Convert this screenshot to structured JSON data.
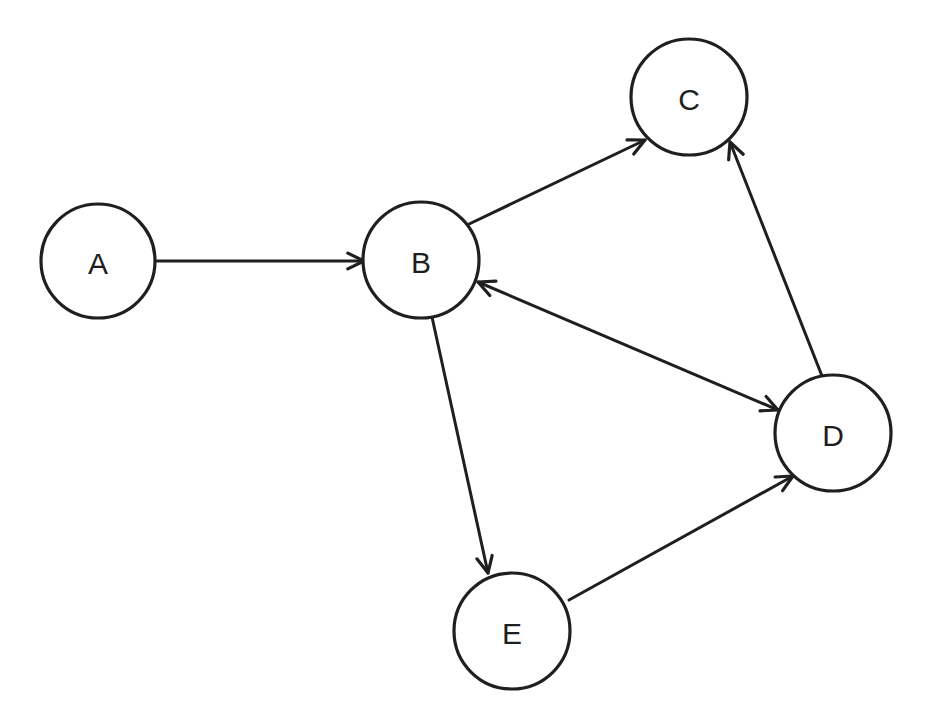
{
  "diagram": {
    "type": "directed-graph",
    "colors": {
      "stroke": "#1f1f1f",
      "background": "#ffffff",
      "node_fill": "#ffffff"
    },
    "nodes": [
      {
        "id": "A",
        "label": "A",
        "cx": 98,
        "cy": 261,
        "r": 57
      },
      {
        "id": "B",
        "label": "B",
        "cx": 421,
        "cy": 260,
        "r": 58
      },
      {
        "id": "C",
        "label": "C",
        "cx": 689,
        "cy": 97,
        "r": 58
      },
      {
        "id": "D",
        "label": "D",
        "cx": 833,
        "cy": 433,
        "r": 58
      },
      {
        "id": "E",
        "label": "E",
        "cx": 512,
        "cy": 631,
        "r": 58
      }
    ],
    "edges": [
      {
        "from": "A",
        "to": "B",
        "direction": "forward",
        "x1": 155,
        "y1": 261,
        "x2": 364,
        "y2": 261
      },
      {
        "from": "B",
        "to": "C",
        "direction": "forward",
        "x1": 467,
        "y1": 225,
        "x2": 645,
        "y2": 140
      },
      {
        "from": "B",
        "to": "D",
        "direction": "bidirectional",
        "x1": 478,
        "y1": 282,
        "x2": 778,
        "y2": 410
      },
      {
        "from": "B",
        "to": "E",
        "direction": "forward",
        "x1": 432,
        "y1": 317,
        "x2": 488,
        "y2": 573
      },
      {
        "from": "E",
        "to": "D",
        "direction": "forward",
        "x1": 569,
        "y1": 600,
        "x2": 793,
        "y2": 476
      },
      {
        "from": "D",
        "to": "C",
        "direction": "forward",
        "x1": 822,
        "y1": 376,
        "x2": 730,
        "y2": 142
      }
    ]
  }
}
